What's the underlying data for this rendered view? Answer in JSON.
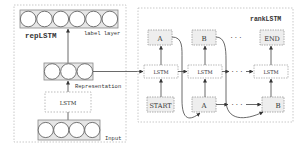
{
  "diagram": {
    "left_panel": {
      "title": "repLSTM",
      "label_layer": {
        "label": "label layer",
        "neuron_count": 6
      },
      "representation_layer": {
        "label": "Representation",
        "neuron_count": 3
      },
      "lstm_box": {
        "label": "LSTM"
      },
      "input_layer": {
        "label": "Input",
        "neuron_count": 4
      }
    },
    "right_panel": {
      "title": "rankLSTM",
      "outputs": [
        "A",
        "B",
        "END"
      ],
      "lstm_cells": [
        "LSTM",
        "LSTM",
        "LSTM"
      ],
      "inputs": [
        "START",
        "A",
        "B"
      ],
      "ellipsis": "· · ·"
    },
    "colors": {
      "line": "#444444",
      "box_fill": "#eeeeee",
      "box_stroke": "#999999",
      "panel_border": "#bbbbbb",
      "neuron_stroke": "#555555",
      "layer_fill": "#e6e6e6"
    }
  }
}
